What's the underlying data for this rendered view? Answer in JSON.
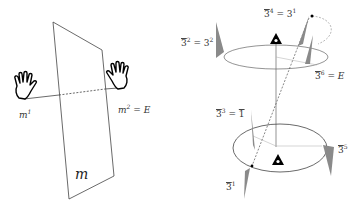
{
  "left_panel": {
    "title": "Mirror plane m",
    "labels": {
      "mirror": "m",
      "m1_base": "m",
      "m1_exp": "1",
      "m2_base": "m",
      "m2_exp": "2",
      "m2_eq": " = E"
    },
    "icons": [
      "left-hand-icon",
      "right-hand-icon"
    ]
  },
  "right_panel": {
    "title": "Rotoinversion axis 3-bar",
    "labels": {
      "op2": {
        "base": "3",
        "exp": "2",
        "eq": " = 3",
        "eq_exp": "2"
      },
      "op4": {
        "base": "3",
        "exp": "4",
        "eq": " = 3",
        "eq_exp": "1"
      },
      "op6": {
        "base": "3",
        "exp": "6",
        "eq": " = E"
      },
      "op3": {
        "base": "3",
        "exp": "3",
        "eq": " = ",
        "eq_rhs": "1"
      },
      "op5": {
        "base": "3",
        "exp": "5"
      },
      "op1": {
        "base": "3",
        "exp": "1"
      }
    },
    "colors": {
      "wedge": "#8a8a8a",
      "line": "#555555",
      "marker": "#000000"
    }
  }
}
